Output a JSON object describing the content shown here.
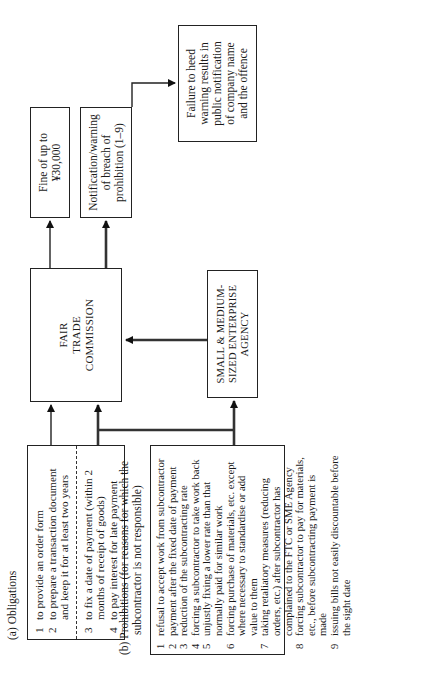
{
  "obligations": {
    "heading": "(a)  Obligations",
    "items": [
      {
        "n": "1",
        "text": "to provide an order form"
      },
      {
        "n": "2",
        "text": "to prepare a transaction document and keep it for at least two years"
      },
      {
        "n": "3",
        "text": "to fix a date of payment (within 2 months of receipt of goods)"
      },
      {
        "n": "4",
        "text": "to pay interest for late payment"
      }
    ]
  },
  "prohibitions": {
    "heading_line1": "(b)  Prohibitions (for reasons for which the",
    "heading_line2": "subcontractor is not responsible)",
    "items": [
      {
        "n": "1",
        "text": "refusal to accept work from subcontractor"
      },
      {
        "n": "2",
        "text": "payment after the fixed date of payment"
      },
      {
        "n": "3",
        "text": "reduction of the subcontracting rate"
      },
      {
        "n": "4",
        "text": "forcing a subcontractor to take work back"
      },
      {
        "n": "5",
        "text": "unjustly fixing a lower rate than that normally paid for similar work"
      },
      {
        "n": "6",
        "text": "forcing purchase of materials, etc. except where necessary to standardise or add value to them"
      },
      {
        "n": "7",
        "text": "taking retaliatory measures (reducing orders, etc.) after subcontractor has complained to the FTC or SME Agency"
      },
      {
        "n": "8",
        "text": "forcing subcontractor to pay for materials, etc., before subcontracting payment is made"
      },
      {
        "n": "9",
        "text": "issuing bills not easily discountable before the sight date"
      }
    ]
  },
  "ftc": {
    "line1": "FAIR",
    "line2": "TRADE",
    "line3": "COMMISSION"
  },
  "sme": {
    "line1": "SMALL & MEDIUM-",
    "line2": "SIZED ENTERPRISE",
    "line3": "AGENCY"
  },
  "fine": {
    "line1": "Fine of up to",
    "line2": "¥30,000"
  },
  "notification": {
    "line1": "Notification/warning",
    "line2": "of breach of",
    "line3": "prohibition (1–9)"
  },
  "failure": {
    "line1": "Failure to heed",
    "line2": "warning results in",
    "line3": "public notification",
    "line4": "of company name",
    "line5": "and the offence"
  }
}
